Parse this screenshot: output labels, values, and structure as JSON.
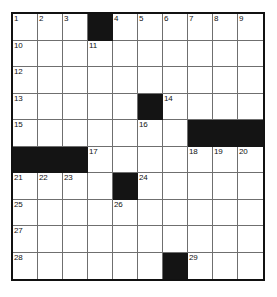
{
  "puzzle": {
    "title": "Crossword Grid",
    "type": "crossword",
    "columns": 10,
    "rows": 10,
    "colors": {
      "block": "#141414",
      "cell": "#ffffff",
      "grid_line": "#6f6f6f",
      "border": "#111111",
      "number_text": "#121212"
    },
    "grid": [
      [
        {
          "block": false,
          "num": "1"
        },
        {
          "block": false,
          "num": "2"
        },
        {
          "block": false,
          "num": "3"
        },
        {
          "block": true,
          "num": ""
        },
        {
          "block": false,
          "num": "4"
        },
        {
          "block": false,
          "num": "5"
        },
        {
          "block": false,
          "num": "6"
        },
        {
          "block": false,
          "num": "7"
        },
        {
          "block": false,
          "num": "8"
        },
        {
          "block": false,
          "num": "9"
        }
      ],
      [
        {
          "block": false,
          "num": "10"
        },
        {
          "block": false,
          "num": ""
        },
        {
          "block": false,
          "num": ""
        },
        {
          "block": false,
          "num": "11"
        },
        {
          "block": false,
          "num": ""
        },
        {
          "block": false,
          "num": ""
        },
        {
          "block": false,
          "num": ""
        },
        {
          "block": false,
          "num": ""
        },
        {
          "block": false,
          "num": ""
        },
        {
          "block": false,
          "num": ""
        }
      ],
      [
        {
          "block": false,
          "num": "12"
        },
        {
          "block": false,
          "num": ""
        },
        {
          "block": false,
          "num": ""
        },
        {
          "block": false,
          "num": ""
        },
        {
          "block": false,
          "num": ""
        },
        {
          "block": false,
          "num": ""
        },
        {
          "block": false,
          "num": ""
        },
        {
          "block": false,
          "num": ""
        },
        {
          "block": false,
          "num": ""
        },
        {
          "block": false,
          "num": ""
        }
      ],
      [
        {
          "block": false,
          "num": "13"
        },
        {
          "block": false,
          "num": ""
        },
        {
          "block": false,
          "num": ""
        },
        {
          "block": false,
          "num": ""
        },
        {
          "block": false,
          "num": ""
        },
        {
          "block": true,
          "num": ""
        },
        {
          "block": false,
          "num": "14"
        },
        {
          "block": false,
          "num": ""
        },
        {
          "block": false,
          "num": ""
        },
        {
          "block": false,
          "num": ""
        }
      ],
      [
        {
          "block": false,
          "num": "15"
        },
        {
          "block": false,
          "num": ""
        },
        {
          "block": false,
          "num": ""
        },
        {
          "block": false,
          "num": ""
        },
        {
          "block": false,
          "num": ""
        },
        {
          "block": false,
          "num": "16"
        },
        {
          "block": false,
          "num": ""
        },
        {
          "block": true,
          "num": ""
        },
        {
          "block": true,
          "num": ""
        },
        {
          "block": true,
          "num": ""
        }
      ],
      [
        {
          "block": true,
          "num": ""
        },
        {
          "block": true,
          "num": ""
        },
        {
          "block": true,
          "num": ""
        },
        {
          "block": false,
          "num": "17"
        },
        {
          "block": false,
          "num": ""
        },
        {
          "block": false,
          "num": ""
        },
        {
          "block": false,
          "num": ""
        },
        {
          "block": false,
          "num": "18"
        },
        {
          "block": false,
          "num": "19"
        },
        {
          "block": false,
          "num": "20"
        }
      ],
      [
        {
          "block": false,
          "num": "21"
        },
        {
          "block": false,
          "num": "22"
        },
        {
          "block": false,
          "num": "23"
        },
        {
          "block": false,
          "num": ""
        },
        {
          "block": true,
          "num": ""
        },
        {
          "block": false,
          "num": "24"
        },
        {
          "block": false,
          "num": ""
        },
        {
          "block": false,
          "num": ""
        },
        {
          "block": false,
          "num": ""
        },
        {
          "block": false,
          "num": ""
        }
      ],
      [
        {
          "block": false,
          "num": "25"
        },
        {
          "block": false,
          "num": ""
        },
        {
          "block": false,
          "num": ""
        },
        {
          "block": false,
          "num": ""
        },
        {
          "block": false,
          "num": "26"
        },
        {
          "block": false,
          "num": ""
        },
        {
          "block": false,
          "num": ""
        },
        {
          "block": false,
          "num": ""
        },
        {
          "block": false,
          "num": ""
        },
        {
          "block": false,
          "num": ""
        }
      ],
      [
        {
          "block": false,
          "num": "27"
        },
        {
          "block": false,
          "num": ""
        },
        {
          "block": false,
          "num": ""
        },
        {
          "block": false,
          "num": ""
        },
        {
          "block": false,
          "num": ""
        },
        {
          "block": false,
          "num": ""
        },
        {
          "block": false,
          "num": ""
        },
        {
          "block": false,
          "num": ""
        },
        {
          "block": false,
          "num": ""
        },
        {
          "block": false,
          "num": ""
        }
      ],
      [
        {
          "block": false,
          "num": "28"
        },
        {
          "block": false,
          "num": ""
        },
        {
          "block": false,
          "num": ""
        },
        {
          "block": false,
          "num": ""
        },
        {
          "block": false,
          "num": ""
        },
        {
          "block": false,
          "num": ""
        },
        {
          "block": true,
          "num": ""
        },
        {
          "block": false,
          "num": "29"
        },
        {
          "block": false,
          "num": ""
        },
        {
          "block": false,
          "num": ""
        }
      ]
    ]
  }
}
